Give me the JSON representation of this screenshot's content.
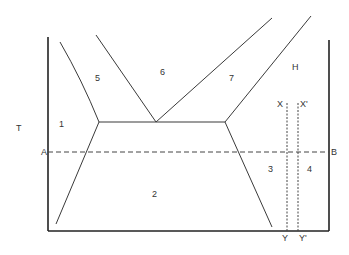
{
  "diagram": {
    "type": "phase-diagram",
    "axis_label_y": "T",
    "region_labels": {
      "r1": "1",
      "r2": "2",
      "r3": "3",
      "r4": "4",
      "r5": "5",
      "r6": "6",
      "r7": "7",
      "rH": "H"
    },
    "line_labels": {
      "A": "A",
      "B": "B",
      "X": "X",
      "X_prime": "X'",
      "Y": "Y",
      "Y_prime": "Y'"
    },
    "colors": {
      "line": "#3a3a3a",
      "axis": "#222222",
      "background": "#ffffff"
    }
  }
}
